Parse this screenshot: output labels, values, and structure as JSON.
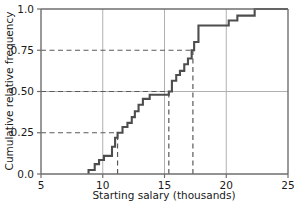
{
  "chart_data": {
    "type": "line",
    "subtype": "empirical-cdf-step",
    "title": "",
    "xlabel": "Starting salary (thousands)",
    "ylabel": "Cumulative relative frequency",
    "xlim": [
      5,
      25
    ],
    "ylim": [
      0.0,
      1.0
    ],
    "xticks": [
      5,
      10,
      15,
      20,
      25
    ],
    "xticklabels": [
      "5",
      "10",
      "15",
      "20",
      "25"
    ],
    "yticks": [
      0.0,
      0.25,
      0.5,
      0.75,
      1.0
    ],
    "yticklabels": [
      "0.0",
      "0.25",
      "0.50",
      "0.75",
      "1.0"
    ],
    "grid": {
      "vertical": [
        10,
        15,
        20
      ],
      "horizontal": [
        0.5
      ],
      "visible": true,
      "color": "#b4b4b4"
    },
    "line_color": "#4d4d4d",
    "guide_color": "#595959",
    "step_points": [
      {
        "x": 8.85,
        "y": 0.0
      },
      {
        "x": 8.85,
        "y": 0.024
      },
      {
        "x": 9.35,
        "y": 0.024
      },
      {
        "x": 9.35,
        "y": 0.06
      },
      {
        "x": 9.7,
        "y": 0.06
      },
      {
        "x": 9.7,
        "y": 0.085
      },
      {
        "x": 10.1,
        "y": 0.085
      },
      {
        "x": 10.1,
        "y": 0.11
      },
      {
        "x": 10.75,
        "y": 0.11
      },
      {
        "x": 10.75,
        "y": 0.165
      },
      {
        "x": 11.0,
        "y": 0.165
      },
      {
        "x": 11.0,
        "y": 0.22
      },
      {
        "x": 11.2,
        "y": 0.22
      },
      {
        "x": 11.2,
        "y": 0.25
      },
      {
        "x": 11.6,
        "y": 0.25
      },
      {
        "x": 11.6,
        "y": 0.285
      },
      {
        "x": 12.0,
        "y": 0.285
      },
      {
        "x": 12.0,
        "y": 0.31
      },
      {
        "x": 12.35,
        "y": 0.31
      },
      {
        "x": 12.35,
        "y": 0.345
      },
      {
        "x": 12.6,
        "y": 0.345
      },
      {
        "x": 12.6,
        "y": 0.38
      },
      {
        "x": 12.9,
        "y": 0.38
      },
      {
        "x": 12.9,
        "y": 0.42
      },
      {
        "x": 13.25,
        "y": 0.42
      },
      {
        "x": 13.25,
        "y": 0.455
      },
      {
        "x": 13.8,
        "y": 0.455
      },
      {
        "x": 13.8,
        "y": 0.48
      },
      {
        "x": 15.35,
        "y": 0.48
      },
      {
        "x": 15.35,
        "y": 0.5
      },
      {
        "x": 15.6,
        "y": 0.5
      },
      {
        "x": 15.6,
        "y": 0.565
      },
      {
        "x": 15.95,
        "y": 0.565
      },
      {
        "x": 15.95,
        "y": 0.6
      },
      {
        "x": 16.25,
        "y": 0.6
      },
      {
        "x": 16.25,
        "y": 0.625
      },
      {
        "x": 16.6,
        "y": 0.625
      },
      {
        "x": 16.6,
        "y": 0.665
      },
      {
        "x": 16.9,
        "y": 0.665
      },
      {
        "x": 16.9,
        "y": 0.7
      },
      {
        "x": 17.2,
        "y": 0.7
      },
      {
        "x": 17.2,
        "y": 0.75
      },
      {
        "x": 17.4,
        "y": 0.75
      },
      {
        "x": 17.4,
        "y": 0.8
      },
      {
        "x": 17.75,
        "y": 0.8
      },
      {
        "x": 17.75,
        "y": 0.9
      },
      {
        "x": 20.2,
        "y": 0.9
      },
      {
        "x": 20.2,
        "y": 0.93
      },
      {
        "x": 20.9,
        "y": 0.93
      },
      {
        "x": 20.9,
        "y": 0.96
      },
      {
        "x": 22.3,
        "y": 0.96
      },
      {
        "x": 22.3,
        "y": 1.0
      },
      {
        "x": 25.0,
        "y": 1.0
      }
    ],
    "guide_lines": [
      {
        "orientation": "horizontal",
        "value": 0.25,
        "from_x": 5,
        "to_x": 11.2,
        "style": "dashed"
      },
      {
        "orientation": "horizontal",
        "value": 0.5,
        "from_x": 5,
        "to_x": 15.35,
        "style": "dashed"
      },
      {
        "orientation": "horizontal",
        "value": 0.75,
        "from_x": 5,
        "to_x": 17.3,
        "style": "dashed"
      },
      {
        "orientation": "vertical",
        "value": 11.2,
        "from_y": 0.0,
        "to_y": 0.25,
        "style": "dashed"
      },
      {
        "orientation": "vertical",
        "value": 15.35,
        "from_y": 0.0,
        "to_y": 0.5,
        "style": "dashed"
      },
      {
        "orientation": "vertical",
        "value": 17.3,
        "from_y": 0.0,
        "to_y": 0.75,
        "style": "dashed"
      }
    ]
  },
  "axes": {
    "x_title": "Starting salary (thousands)",
    "y_title": "Cumulative relative frequency",
    "x_tick_labels": [
      "5",
      "10",
      "15",
      "20",
      "25"
    ],
    "y_tick_labels": [
      "1.0",
      "0.75",
      "0.50",
      "0.25",
      "0.0"
    ]
  }
}
